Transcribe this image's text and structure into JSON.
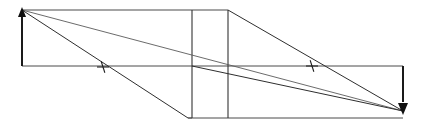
{
  "figure": {
    "kind": "optical-ray-diagram",
    "width": 421,
    "height": 135,
    "background_color": "#ffffff",
    "line_color": "#4a4a4a",
    "ray_color": "#5a5a5a",
    "arrow_color": "#101010"
  },
  "chart_data": {
    "type": "line",
    "title": "",
    "xlabel": "",
    "ylabel": "",
    "xlim": [
      0,
      421
    ],
    "ylim": [
      135,
      0
    ],
    "grid": false,
    "legend": "none",
    "points": {
      "apex_top_left": [
        22,
        10
      ],
      "axis_left": [
        22,
        66
      ],
      "top_edge_right": [
        228,
        10
      ],
      "mid_vertex_left": [
        192,
        66
      ],
      "mid_vertex_right": [
        228,
        66
      ],
      "bottom_left": [
        188,
        118
      ],
      "bottom_right": [
        403,
        118
      ],
      "axis_right": [
        403,
        66
      ],
      "convergence": [
        403,
        111
      ],
      "element_front_top": [
        192,
        10
      ],
      "element_front_bottom": [
        192,
        118
      ],
      "element_back_top": [
        228,
        10
      ],
      "element_back_bottom": [
        228,
        118
      ]
    },
    "series": [
      {
        "name": "top-aperture-edge",
        "kind": "frame",
        "x": [
          22,
          228
        ],
        "y": [
          10,
          10
        ]
      },
      {
        "name": "optical-axis",
        "kind": "frame",
        "x": [
          22,
          403
        ],
        "y": [
          66,
          66
        ]
      },
      {
        "name": "bottom-aperture-edge",
        "kind": "frame",
        "x": [
          188,
          403
        ],
        "y": [
          118,
          118
        ]
      },
      {
        "name": "element-front-face",
        "kind": "element",
        "x": [
          192,
          192
        ],
        "y": [
          10,
          118
        ]
      },
      {
        "name": "element-back-face",
        "kind": "element",
        "x": [
          228,
          228
        ],
        "y": [
          10,
          118
        ]
      },
      {
        "name": "upper-marginal-ray",
        "kind": "ray",
        "x": [
          22,
          403
        ],
        "y": [
          10,
          111
        ]
      },
      {
        "name": "upper-chief-ray",
        "kind": "ray",
        "x": [
          22,
          188
        ],
        "y": [
          10,
          118
        ]
      },
      {
        "name": "lower-exit-ray",
        "kind": "ray",
        "x": [
          192,
          403
        ],
        "y": [
          66,
          111
        ]
      },
      {
        "name": "upper-exit-ray",
        "kind": "ray",
        "x": [
          228,
          403
        ],
        "y": [
          10,
          111
        ]
      },
      {
        "name": "lower-entrance-ray",
        "kind": "ray",
        "x": [
          188,
          192
        ],
        "y": [
          118,
          118
        ]
      }
    ],
    "annotations": [
      {
        "name": "object-height-arrow",
        "type": "arrow",
        "direction": "up",
        "x": 22,
        "y_tail": 66,
        "y_head": 10
      },
      {
        "name": "image-height-arrow",
        "type": "arrow",
        "direction": "down",
        "x": 403,
        "y_tail": 66,
        "y_head": 111
      },
      {
        "name": "left-ray-tick",
        "type": "cross",
        "x": 103,
        "y": 67,
        "size": 6,
        "angle_deg": 72
      },
      {
        "name": "right-ray-tick",
        "type": "cross",
        "x": 312,
        "y": 66,
        "size": 6,
        "angle_deg": 72
      }
    ]
  }
}
